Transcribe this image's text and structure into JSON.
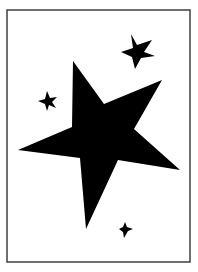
{
  "frame": {
    "x": 7,
    "y": 10,
    "width": 183,
    "height": 252,
    "stroke": "#4a4a4a",
    "stroke_width": 1.6,
    "fill": "#ffffff"
  },
  "stars": [
    {
      "name": "large-star",
      "fill": "#000000",
      "points": "73,61 104,104 162,80 134,129 180,170 118,160 86,229 80,158 18,150 72,127"
    },
    {
      "name": "small-star-upper-right",
      "fill": "#000000",
      "points": "131,34 137,45 152,40 144,52 155,56 141,58 135,69 132,57 121,52 133,48"
    },
    {
      "name": "small-star-left",
      "fill": "#000000",
      "points": "47,91 50,98 57,97 52,102 56,108 49,105 47,111 45,104 38,101 45,99"
    },
    {
      "name": "small-star-bottom",
      "fill": "#000000",
      "points": "125,222 127,227 133,229 128,231 124,238 123,232 119,229 123,227"
    }
  ]
}
